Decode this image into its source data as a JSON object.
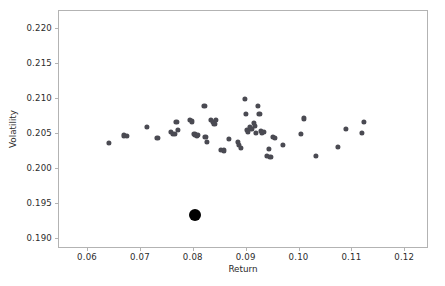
{
  "chart_data": {
    "type": "scatter",
    "title": "",
    "xlabel": "Return",
    "ylabel": "Volatility",
    "xlim": [
      0.0545,
      0.1245
    ],
    "ylim": [
      0.1885,
      0.2225
    ],
    "xticks": [
      0.06,
      0.07,
      0.08,
      0.09,
      0.1,
      0.11,
      0.12
    ],
    "xticklabels": [
      "0.06",
      "0.07",
      "0.08",
      "0.09",
      "0.10",
      "0.11",
      "0.12"
    ],
    "yticks": [
      0.19,
      0.195,
      0.2,
      0.205,
      0.21,
      0.215,
      0.22
    ],
    "yticklabels": [
      "0.190",
      "0.195",
      "0.200",
      "0.205",
      "0.210",
      "0.215",
      "0.220"
    ],
    "grid": false,
    "legend": null,
    "series": [
      {
        "name": "portfolios",
        "marker": "circle",
        "color": "#4a4a52",
        "size": 5.2,
        "points": [
          [
            0.064,
            0.20368
          ],
          [
            0.0668,
            0.20473
          ],
          [
            0.0673,
            0.20463
          ],
          [
            0.0711,
            0.20594
          ],
          [
            0.0731,
            0.20435
          ],
          [
            0.0757,
            0.20525
          ],
          [
            0.076,
            0.205
          ],
          [
            0.0764,
            0.2049
          ],
          [
            0.0767,
            0.20665
          ],
          [
            0.077,
            0.20553
          ],
          [
            0.0793,
            0.20696
          ],
          [
            0.0797,
            0.20672
          ],
          [
            0.0801,
            0.205
          ],
          [
            0.0803,
            0.20475
          ],
          [
            0.0806,
            0.20461
          ],
          [
            0.0808,
            0.20482
          ],
          [
            0.082,
            0.2089
          ],
          [
            0.0822,
            0.2045
          ],
          [
            0.0825,
            0.20378
          ],
          [
            0.0833,
            0.2069
          ],
          [
            0.0836,
            0.2066
          ],
          [
            0.0839,
            0.2064
          ],
          [
            0.0842,
            0.2069
          ],
          [
            0.0852,
            0.20262
          ],
          [
            0.0857,
            0.20258
          ],
          [
            0.0866,
            0.20428
          ],
          [
            0.0884,
            0.20378
          ],
          [
            0.0886,
            0.20338
          ],
          [
            0.0889,
            0.20295
          ],
          [
            0.0897,
            0.21
          ],
          [
            0.0898,
            0.20775
          ],
          [
            0.0901,
            0.20555
          ],
          [
            0.0903,
            0.2052
          ],
          [
            0.0906,
            0.20593
          ],
          [
            0.0909,
            0.2056
          ],
          [
            0.0913,
            0.20655
          ],
          [
            0.0915,
            0.20608
          ],
          [
            0.0918,
            0.20503
          ],
          [
            0.0922,
            0.2089
          ],
          [
            0.0924,
            0.2078
          ],
          [
            0.0927,
            0.2054
          ],
          [
            0.0929,
            0.20505
          ],
          [
            0.0932,
            0.20528
          ],
          [
            0.0938,
            0.2018
          ],
          [
            0.0942,
            0.2028
          ],
          [
            0.0945,
            0.2016
          ],
          [
            0.095,
            0.20455
          ],
          [
            0.0954,
            0.2044
          ],
          [
            0.0968,
            0.20335
          ],
          [
            0.1008,
            0.20715
          ],
          [
            0.1003,
            0.20492
          ],
          [
            0.1031,
            0.2018
          ],
          [
            0.1073,
            0.20305
          ],
          [
            0.1088,
            0.2057
          ],
          [
            0.1118,
            0.20505
          ],
          [
            0.1122,
            0.2067
          ]
        ]
      },
      {
        "name": "highlighted",
        "marker": "circle",
        "color": "#000000",
        "size": 12,
        "points": [
          [
            0.0803,
            0.1933
          ]
        ]
      }
    ]
  },
  "figure": {
    "caption_partial": ""
  }
}
